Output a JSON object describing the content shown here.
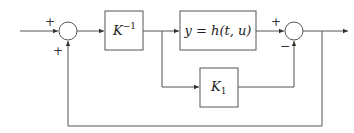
{
  "diagram": {
    "type": "block-diagram",
    "colors": {
      "stroke": "#555555",
      "text": "#222222",
      "background": "#ffffff"
    },
    "summers": [
      {
        "id": "sum1",
        "inputs": [
          {
            "from": "input",
            "sign": "+"
          },
          {
            "from": "feedback",
            "sign": "+"
          }
        ]
      },
      {
        "id": "sum2",
        "inputs": [
          {
            "from": "h-block",
            "sign": "+"
          },
          {
            "from": "k1-block",
            "sign": "−"
          }
        ]
      }
    ],
    "blocks": {
      "k_inverse": {
        "base": "K",
        "sup": "−1"
      },
      "plant": {
        "text": "y = h(t, u)"
      },
      "k1": {
        "base": "K",
        "sub": "1"
      }
    },
    "signs": {
      "sum1_top": "+",
      "sum1_bottom": "+",
      "sum2_top": "+",
      "sum2_bottom": "−"
    }
  }
}
